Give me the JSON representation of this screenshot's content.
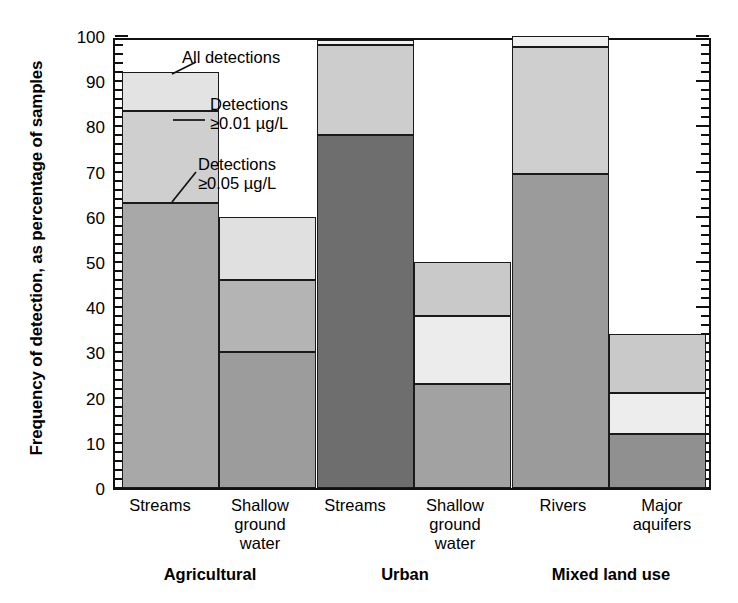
{
  "chart_data": {
    "type": "bar",
    "subtype": "stacked-bar",
    "title": "",
    "xlabel": "",
    "ylabel": "Frequency of detection, as percentage of samples",
    "ylim": [
      0,
      100
    ],
    "ytick_major_step": 10,
    "ytick_minor_step": 2,
    "ytick_labels": [
      "0",
      "10",
      "20",
      "30",
      "40",
      "50",
      "60",
      "70",
      "80",
      "90",
      "100"
    ],
    "grid": false,
    "legend_position": "inline-annotations",
    "series": [
      {
        "name": "Detections ≥0.05 µg/L",
        "key": "ge005",
        "color": "#a8a8a8"
      },
      {
        "name": "Detections ≥0.01 µg/L",
        "key": "ge001",
        "color": "#cfcfcf"
      },
      {
        "name": "All detections",
        "key": "all",
        "color": "#e3e3e3"
      }
    ],
    "groups": [
      {
        "label": "Agricultural",
        "categories": [
          "Streams",
          "Shallow\nground\nwater"
        ],
        "bars": [
          {
            "category": "Streams",
            "ge005": 63,
            "ge001": 83.5,
            "all": 92,
            "fill_bottom": "#a8a8a8",
            "fill_mid": "#cfcfcf",
            "fill_top": "#e3e3e3"
          },
          {
            "category": "Shallow ground water",
            "ge005": 30,
            "ge001": 46,
            "all": 60,
            "fill_bottom": "#9c9c9c",
            "fill_mid": "#b4b4b4",
            "fill_top": "#e0e0e0"
          }
        ]
      },
      {
        "label": "Urban",
        "categories": [
          "Streams",
          "Shallow\nground\nwater"
        ],
        "bars": [
          {
            "category": "Streams",
            "ge005": 78,
            "ge001": 98,
            "all": 99.2,
            "fill_bottom": "#6e6e6e",
            "fill_mid": "#cdcdcd",
            "fill_top": "#f2f2f2"
          },
          {
            "category": "Shallow ground water",
            "ge005": 23,
            "ge001": 38,
            "all": 50,
            "fill_bottom": "#a2a2a2",
            "fill_mid": "#ececec",
            "fill_top": "#c9c9c9"
          }
        ]
      },
      {
        "label": "Mixed land use",
        "categories": [
          "Rivers",
          "Major\naquifers"
        ],
        "bars": [
          {
            "category": "Rivers",
            "ge005": 69.5,
            "ge001": 97.5,
            "all": 100,
            "fill_bottom": "#9b9b9b",
            "fill_mid": "#cfcfcf",
            "fill_top": "#f0f0f0"
          },
          {
            "category": "Major aquifers",
            "ge005": 12,
            "ge001": 21,
            "all": 34,
            "fill_bottom": "#909090",
            "fill_mid": "#ededed",
            "fill_top": "#c9c9c9"
          }
        ]
      }
    ],
    "annotations": [
      {
        "name": "all-detections",
        "text": "All detections"
      },
      {
        "name": "detections-ge-001",
        "text": "Detections\n≥0.01 µg/L"
      },
      {
        "name": "detections-ge-005",
        "text": "Detections\n≥0.05 µg/L"
      }
    ]
  },
  "axis": {
    "y_title": "Frequency of detection, as percentage of samples",
    "ticks": [
      "100",
      "90",
      "80",
      "70",
      "60",
      "50",
      "40",
      "30",
      "20",
      "10",
      "0"
    ]
  },
  "labels": {
    "cat_ag_streams": "Streams",
    "cat_ag_sgw": "Shallow\nground\nwater",
    "cat_ur_streams": "Streams",
    "cat_ur_sgw": "Shallow\nground\nwater",
    "cat_mx_rivers": "Rivers",
    "cat_mx_aquifers": "Major\naquifers",
    "grp_agricultural": "Agricultural",
    "grp_urban": "Urban",
    "grp_mixed": "Mixed land use"
  },
  "annotations": {
    "all_detections": "All detections",
    "ge_001": "Detections\n≥0.01 µg/L",
    "ge_005": "Detections\n≥0.05 µg/L"
  }
}
